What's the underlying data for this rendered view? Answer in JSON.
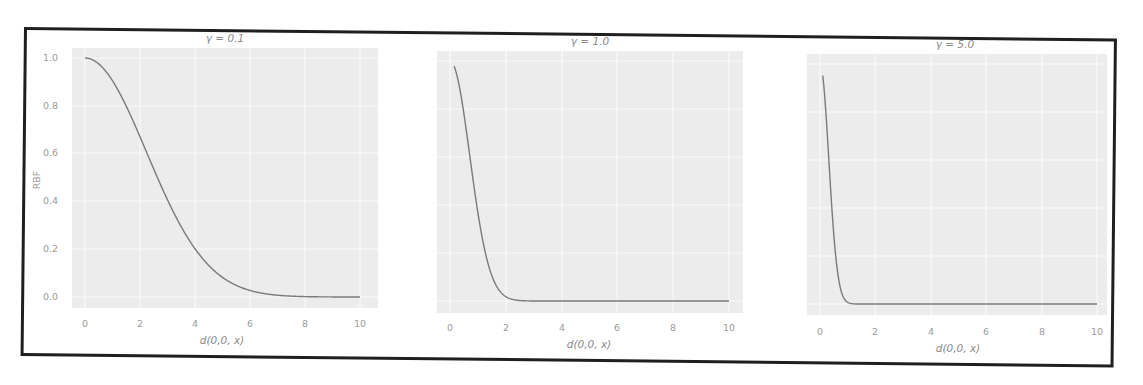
{
  "chart_data": [
    {
      "type": "line",
      "title": "γ = 0.1",
      "xlabel": "d(0,0, x)",
      "ylabel": "RBF",
      "xlim": [
        0,
        10
      ],
      "ylim": [
        0.0,
        1.0
      ],
      "xticks": [
        "0",
        "2",
        "4",
        "6",
        "8",
        "10"
      ],
      "yticks": [
        "0.0",
        "0.2",
        "0.4",
        "0.6",
        "0.8",
        "1.0"
      ],
      "grid": true,
      "gamma": 0.1,
      "x": [
        0,
        1,
        2,
        3,
        4,
        5,
        6,
        7,
        8,
        9,
        10
      ],
      "values": [
        1.0,
        0.905,
        0.67,
        0.407,
        0.202,
        0.082,
        0.027,
        0.007,
        0.002,
        0.0003,
        0.0
      ]
    },
    {
      "type": "line",
      "title": "γ = 1.0",
      "xlabel": "d(0,0, x)",
      "ylabel": "",
      "xlim": [
        0,
        10
      ],
      "ylim": [
        0.0,
        1.0
      ],
      "xticks": [
        "0",
        "2",
        "4",
        "6",
        "8",
        "10"
      ],
      "yticks": [],
      "grid": true,
      "gamma": 1.0,
      "x": [
        0.15,
        0.5,
        1,
        1.5,
        2,
        2.5,
        3,
        4,
        6,
        8,
        10
      ],
      "values": [
        0.98,
        0.78,
        0.37,
        0.105,
        0.018,
        0.002,
        0.0,
        0.0,
        0.0,
        0.0,
        0.0
      ]
    },
    {
      "type": "line",
      "title": "γ = 5.0",
      "xlabel": "d(0,0, x)",
      "ylabel": "",
      "xlim": [
        0,
        10
      ],
      "ylim": [
        0.0,
        1.0
      ],
      "xticks": [
        "0",
        "2",
        "4",
        "6",
        "8",
        "10"
      ],
      "yticks": [],
      "grid": true,
      "gamma": 5.0,
      "x": [
        0.1,
        0.25,
        0.5,
        0.75,
        1,
        1.5,
        2,
        4,
        6,
        8,
        10
      ],
      "values": [
        0.95,
        0.73,
        0.29,
        0.06,
        0.007,
        0.0,
        0.0,
        0.0,
        0.0,
        0.0,
        0.0
      ]
    }
  ],
  "panels": [
    {
      "title": "γ = 0.1",
      "xlabel": "d(0,0, x)",
      "ylabel": "RBF",
      "xticks": [
        "0",
        "2",
        "4",
        "6",
        "8",
        "10"
      ],
      "yticks": [
        "1.0",
        "0.8",
        "0.6",
        "0.4",
        "0.2",
        "0.0"
      ]
    },
    {
      "title": "γ = 1.0",
      "xlabel": "d(0,0, x)",
      "xticks": [
        "0",
        "2",
        "4",
        "6",
        "8",
        "10"
      ]
    },
    {
      "title": "γ = 5.0",
      "xlabel": "d(0,0, x)",
      "xticks": [
        "0",
        "2",
        "4",
        "6",
        "8",
        "10"
      ]
    }
  ],
  "colors": {
    "plot_bg": "#ececec",
    "grid": "#fafafa",
    "line": "#7a7a7a",
    "frame": "#1f1f1f",
    "text": "#999999"
  }
}
